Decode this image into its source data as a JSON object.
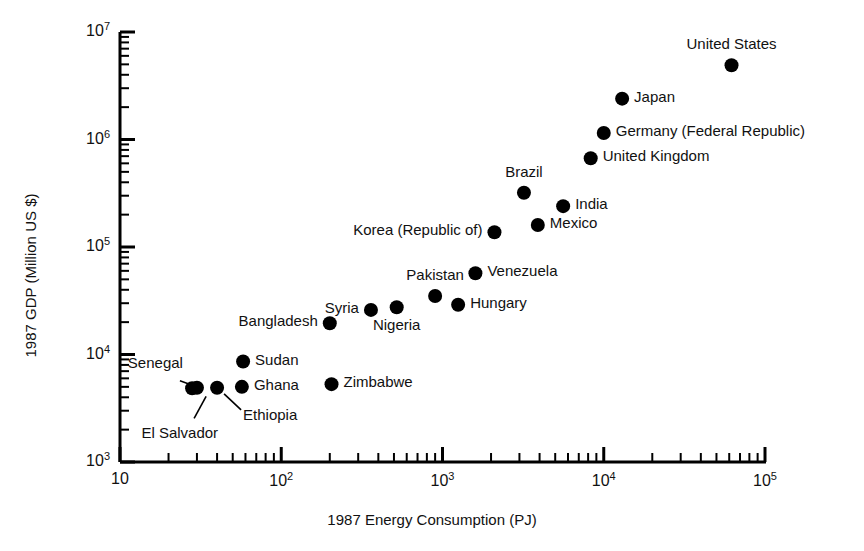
{
  "chart_data": {
    "type": "scatter",
    "title": "",
    "xlabel": "1987 Energy Consumption (PJ)",
    "ylabel": "1987 GDP (Million US $)",
    "xscale": "log",
    "yscale": "log",
    "xlim": [
      10,
      100000
    ],
    "ylim": [
      1000,
      10000000
    ],
    "grid": false,
    "legend": "none",
    "xticks": [
      {
        "value": 10,
        "label": "10"
      },
      {
        "value": 100,
        "label": "10²"
      },
      {
        "value": 1000,
        "label": "10³"
      },
      {
        "value": 10000,
        "label": "10⁴"
      },
      {
        "value": 100000,
        "label": "10⁵"
      }
    ],
    "yticks": [
      {
        "value": 1000,
        "label": "10³"
      },
      {
        "value": 10000,
        "label": "10⁴"
      },
      {
        "value": 100000,
        "label": "10⁵"
      },
      {
        "value": 1000000,
        "label": "10⁶"
      },
      {
        "value": 10000000,
        "label": "10⁷"
      }
    ],
    "points": [
      {
        "name": "United States",
        "x": 62000,
        "y": 4900000,
        "label_pos": "above"
      },
      {
        "name": "Japan",
        "x": 13000,
        "y": 2400000,
        "label_pos": "right"
      },
      {
        "name": "Germany (Federal Republic)",
        "x": 10000,
        "y": 1150000,
        "label_pos": "right"
      },
      {
        "name": "United Kingdom",
        "x": 8300,
        "y": 670000,
        "label_pos": "right"
      },
      {
        "name": "Brazil",
        "x": 3200,
        "y": 320000,
        "label_pos": "above"
      },
      {
        "name": "India",
        "x": 5600,
        "y": 240000,
        "label_pos": "right"
      },
      {
        "name": "Mexico",
        "x": 3900,
        "y": 160000,
        "label_pos": "right"
      },
      {
        "name": "Korea (Republic of)",
        "x": 2100,
        "y": 137000,
        "label_pos": "left"
      },
      {
        "name": "Venezuela",
        "x": 1600,
        "y": 57000,
        "label_pos": "right"
      },
      {
        "name": "Pakistan",
        "x": 900,
        "y": 35000,
        "label_pos": "above"
      },
      {
        "name": "Hungary",
        "x": 1250,
        "y": 29000,
        "label_pos": "right"
      },
      {
        "name": "Nigeria",
        "x": 520,
        "y": 27500,
        "label_pos": "below"
      },
      {
        "name": "Syria",
        "x": 360,
        "y": 26000,
        "label_pos": "left"
      },
      {
        "name": "Bangladesh",
        "x": 200,
        "y": 19500,
        "label_pos": "left"
      },
      {
        "name": "Sudan",
        "x": 58,
        "y": 8600,
        "label_pos": "right"
      },
      {
        "name": "Zimbabwe",
        "x": 205,
        "y": 5300,
        "label_pos": "right"
      },
      {
        "name": "Ghana",
        "x": 57,
        "y": 5000,
        "label_pos": "right"
      },
      {
        "name": "Ethiopia",
        "x": 40,
        "y": 4900,
        "label_pos": "leader-below-right"
      },
      {
        "name": "Senegal",
        "x": 30,
        "y": 4900,
        "label_pos": "leader-above-left"
      },
      {
        "name": "El Salvador",
        "x": 28,
        "y": 4850,
        "label_pos": "leader-below-left"
      }
    ]
  },
  "style": {
    "marker_color": "#000000",
    "axis_color": "#000000",
    "background": "#ffffff",
    "marker_radius": 7
  }
}
